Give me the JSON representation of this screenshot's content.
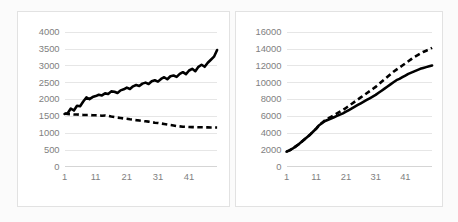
{
  "page": {
    "background_color": "#fbfbfb",
    "card_background": "#ffffff",
    "card_border_color": "#e2e2e2",
    "gridline_color": "#e6e6e6",
    "tick_label_color": "#7f7f7f",
    "series_color": "#000000"
  },
  "chart_data": [
    {
      "id": "left-chart",
      "type": "line",
      "title": "",
      "subtitle": "",
      "xlabel": "",
      "ylabel": "",
      "grid": true,
      "grid_axis": "y",
      "legend": false,
      "legend_position": "none",
      "xlim": [
        1,
        50
      ],
      "ylim": [
        0,
        4000
      ],
      "ytick_values": [
        0,
        500,
        1000,
        1500,
        2000,
        2500,
        3000,
        3500,
        4000
      ],
      "ytick_labels": [
        "0",
        "500",
        "1000",
        "1500",
        "2000",
        "2500",
        "3000",
        "3500",
        "4000"
      ],
      "xtick_values": [
        1,
        11,
        21,
        31,
        41
      ],
      "xtick_labels": [
        "1",
        "11",
        "21",
        "31",
        "41"
      ],
      "x": [
        1,
        2,
        3,
        4,
        5,
        6,
        7,
        8,
        9,
        10,
        11,
        12,
        13,
        14,
        15,
        16,
        17,
        18,
        19,
        20,
        21,
        22,
        23,
        24,
        25,
        26,
        27,
        28,
        29,
        30,
        31,
        32,
        33,
        34,
        35,
        36,
        37,
        38,
        39,
        40,
        41,
        42,
        43,
        44,
        45,
        46,
        47,
        48,
        49,
        50
      ],
      "series": [
        {
          "name": "solid-series",
          "style": "solid",
          "values": [
            1560,
            1580,
            1720,
            1660,
            1800,
            1790,
            1930,
            2050,
            2000,
            2060,
            2090,
            2130,
            2110,
            2170,
            2150,
            2230,
            2220,
            2180,
            2260,
            2290,
            2340,
            2300,
            2380,
            2420,
            2390,
            2460,
            2490,
            2450,
            2530,
            2560,
            2520,
            2600,
            2650,
            2590,
            2680,
            2700,
            2660,
            2750,
            2800,
            2740,
            2850,
            2900,
            2830,
            2960,
            3020,
            2960,
            3080,
            3170,
            3260,
            3460
          ]
        },
        {
          "name": "dashed-series",
          "style": "dashed",
          "values": [
            1570,
            1555,
            1548,
            1540,
            1545,
            1535,
            1530,
            1525,
            1528,
            1520,
            1518,
            1512,
            1508,
            1515,
            1500,
            1480,
            1465,
            1450,
            1440,
            1425,
            1415,
            1400,
            1390,
            1375,
            1365,
            1350,
            1340,
            1330,
            1315,
            1300,
            1290,
            1275,
            1260,
            1245,
            1230,
            1215,
            1200,
            1190,
            1180,
            1175,
            1170,
            1168,
            1165,
            1163,
            1162,
            1160,
            1160,
            1158,
            1158,
            1157
          ]
        }
      ]
    },
    {
      "id": "right-chart",
      "type": "line",
      "title": "",
      "subtitle": "",
      "xlabel": "",
      "ylabel": "",
      "grid": true,
      "grid_axis": "y",
      "legend": false,
      "legend_position": "none",
      "xlim": [
        1,
        50
      ],
      "ylim": [
        0,
        16000
      ],
      "ytick_values": [
        0,
        2000,
        4000,
        6000,
        8000,
        10000,
        12000,
        14000,
        16000
      ],
      "ytick_labels": [
        "0",
        "2000",
        "4000",
        "6000",
        "8000",
        "10000",
        "12000",
        "14000",
        "16000"
      ],
      "xtick_values": [
        1,
        11,
        21,
        31,
        41
      ],
      "xtick_labels": [
        "1",
        "11",
        "21",
        "31",
        "41"
      ],
      "x": [
        1,
        2,
        3,
        4,
        5,
        6,
        7,
        8,
        9,
        10,
        11,
        12,
        13,
        14,
        15,
        16,
        17,
        18,
        19,
        20,
        21,
        22,
        23,
        24,
        25,
        26,
        27,
        28,
        29,
        30,
        31,
        32,
        33,
        34,
        35,
        36,
        37,
        38,
        39,
        40,
        41,
        42,
        43,
        44,
        45,
        46,
        47,
        48,
        49,
        50
      ],
      "series": [
        {
          "name": "solid-series",
          "style": "solid",
          "values": [
            1750,
            1900,
            2100,
            2350,
            2600,
            2900,
            3200,
            3500,
            3800,
            4150,
            4500,
            4900,
            5150,
            5400,
            5550,
            5700,
            5850,
            6000,
            6150,
            6300,
            6500,
            6700,
            6900,
            7100,
            7300,
            7500,
            7700,
            7900,
            8100,
            8300,
            8500,
            8750,
            9000,
            9250,
            9500,
            9750,
            10000,
            10250,
            10400,
            10600,
            10800,
            11000,
            11150,
            11300,
            11450,
            11600,
            11700,
            11800,
            11900,
            12000
          ]
        },
        {
          "name": "dashed-series",
          "style": "dashed",
          "values": [
            1750,
            1900,
            2100,
            2350,
            2600,
            2900,
            3200,
            3500,
            3800,
            4150,
            4500,
            4900,
            5200,
            5500,
            5700,
            5900,
            6100,
            6300,
            6500,
            6700,
            6950,
            7200,
            7450,
            7700,
            7950,
            8200,
            8450,
            8700,
            8950,
            9200,
            9450,
            9750,
            10050,
            10350,
            10650,
            10950,
            11250,
            11500,
            11750,
            12000,
            12250,
            12500,
            12750,
            13000,
            13200,
            13400,
            13600,
            13750,
            13900,
            14100
          ]
        }
      ]
    }
  ]
}
